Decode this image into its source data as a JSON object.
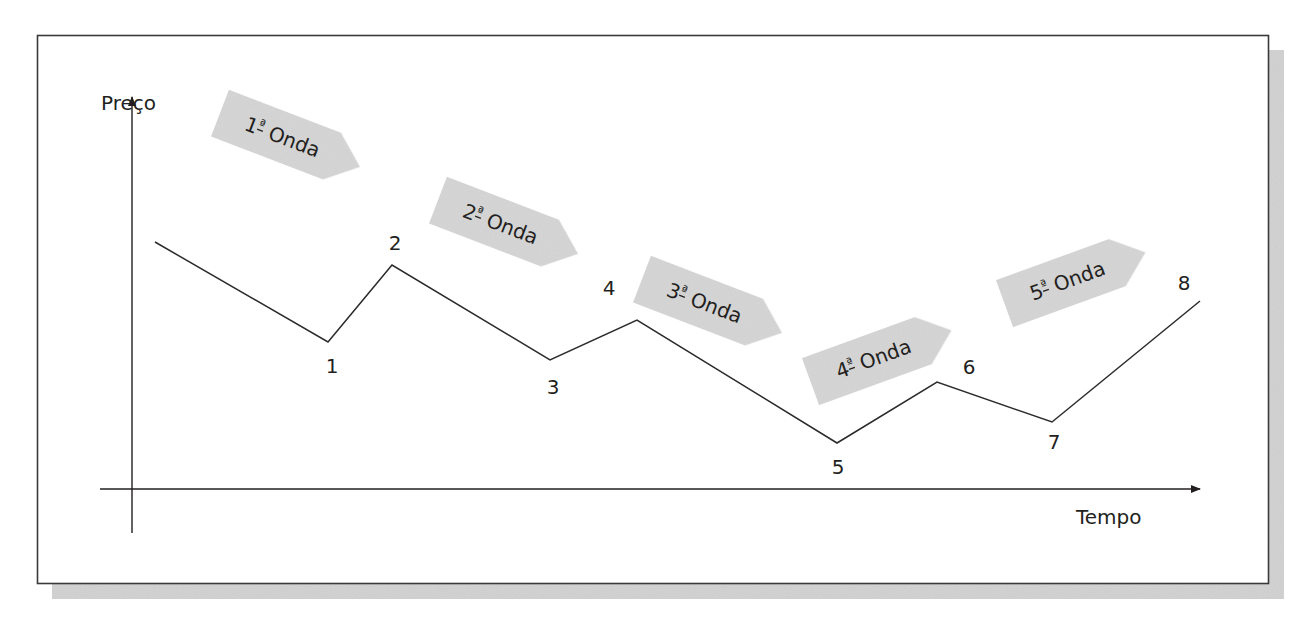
{
  "diagram": {
    "type": "elliott-wave-style price vs time diagram",
    "axes": {
      "y_label": "Preço",
      "x_label": "Tempo"
    },
    "colors": {
      "frame": "#3a3a3a",
      "shadow": "#cfcfcf",
      "line": "#2b2b2b",
      "tag_fill": "#d6d6d6",
      "text": "#231f20"
    },
    "path_start": {
      "x": 155,
      "y": 242
    },
    "points": [
      {
        "label": "1",
        "x": 328,
        "y": 342,
        "lx": 332,
        "ly": 373
      },
      {
        "label": "2",
        "x": 392,
        "y": 265,
        "lx": 395,
        "ly": 250
      },
      {
        "label": "3",
        "x": 550,
        "y": 360,
        "lx": 553,
        "ly": 394
      },
      {
        "label": "4",
        "x": 637,
        "y": 320,
        "lx": 609,
        "ly": 295
      },
      {
        "label": "5",
        "x": 837,
        "y": 443,
        "lx": 838,
        "ly": 474
      },
      {
        "label": "6",
        "x": 937,
        "y": 382,
        "lx": 969,
        "ly": 374
      },
      {
        "label": "7",
        "x": 1052,
        "y": 422,
        "lx": 1054,
        "ly": 449
      },
      {
        "label": "8",
        "x": 1200,
        "y": 301,
        "lx": 1184,
        "ly": 290
      }
    ],
    "waves": [
      {
        "ordinal": "1",
        "suffix": "ª",
        "word": "Onda",
        "cx": 290,
        "cy": 140,
        "angle": 21
      },
      {
        "ordinal": "2",
        "suffix": "ª",
        "word": "Onda",
        "cx": 508,
        "cy": 227,
        "angle": 21
      },
      {
        "ordinal": "3",
        "suffix": "ª",
        "word": "Onda",
        "cx": 712,
        "cy": 306,
        "angle": 21
      },
      {
        "ordinal": "4",
        "suffix": "ª",
        "word": "Onda",
        "cx": 881,
        "cy": 356,
        "angle": -20
      },
      {
        "ordinal": "5",
        "suffix": "ª",
        "word": "Onda",
        "cx": 1075,
        "cy": 278,
        "angle": -20
      }
    ]
  }
}
